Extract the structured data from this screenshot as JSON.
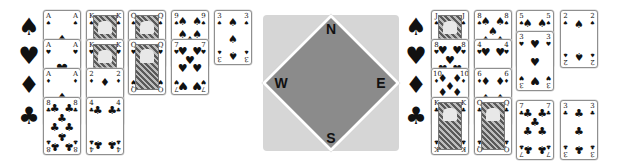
{
  "table": {
    "compass": {
      "north": "N",
      "east": "E",
      "south": "S",
      "west": "W"
    },
    "colors": {
      "panel": "#d6d6d6",
      "diamond": "#8b8b8b",
      "border": "#ffffff",
      "ink": "#111111"
    }
  },
  "suit_icons": {
    "spades": "♠",
    "hearts": "♥",
    "diamonds": "♦",
    "clubs": "♣"
  },
  "west_hand": {
    "suit_labels": [
      "♠",
      "♥",
      "♦",
      "♣"
    ],
    "spades": [
      "A",
      "K",
      "Q",
      "9",
      "3"
    ],
    "hearts": [
      "A",
      "K",
      "Q",
      "7"
    ],
    "diamonds": [
      "A",
      "2"
    ],
    "clubs": [
      "8",
      "4"
    ]
  },
  "east_hand": {
    "suit_labels": [
      "♠",
      "♥",
      "♦",
      "♣"
    ],
    "spades": [
      "J",
      "8",
      "5",
      "2"
    ],
    "hearts": [
      "8",
      "4",
      "3"
    ],
    "diamonds": [
      "10",
      "6"
    ],
    "clubs": [
      "K",
      "Q",
      "7",
      "3"
    ]
  }
}
